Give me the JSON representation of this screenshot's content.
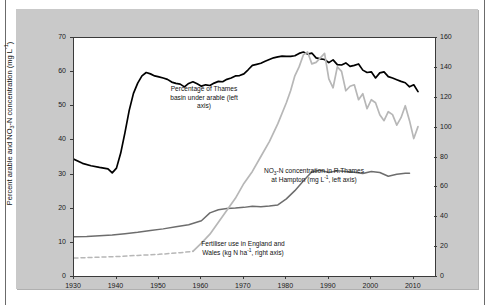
{
  "figure": {
    "panel_bg": "#c9c9c9",
    "plot_bg": "#ffffff"
  },
  "chart_data": {
    "type": "line",
    "title": "",
    "xlabel": "",
    "ylabel": "Percent arable and NO3-N concentration (mg L-1)",
    "y2label": "Fertiliser use (kg N ha-1)",
    "xlim": [
      1930,
      2015
    ],
    "ylim": [
      0,
      70
    ],
    "y2lim": [
      0,
      160
    ],
    "grid": false,
    "legend_position": "inline-annotations",
    "xticks": [
      1930,
      1940,
      1950,
      1960,
      1970,
      1980,
      1990,
      2000,
      2010
    ],
    "yticks": [
      0,
      10,
      20,
      30,
      40,
      50,
      60,
      70
    ],
    "y2ticks": [
      0,
      20,
      40,
      60,
      80,
      100,
      120,
      140,
      160
    ],
    "series": [
      {
        "name": "Percentage of Thames basin under arable",
        "axis": "left",
        "color": "#000000",
        "width": 1.7,
        "style": "solid",
        "x": [
          1930,
          1932,
          1934,
          1936,
          1938,
          1939,
          1940,
          1941,
          1942,
          1943,
          1944,
          1945,
          1946,
          1947,
          1948,
          1949,
          1950,
          1951,
          1952,
          1953,
          1954,
          1955,
          1956,
          1957,
          1958,
          1959,
          1960,
          1961,
          1962,
          1963,
          1964,
          1965,
          1966,
          1967,
          1968,
          1969,
          1970,
          1971,
          1972,
          1973,
          1974,
          1975,
          1976,
          1977,
          1978,
          1979,
          1980,
          1981,
          1982,
          1983,
          1984,
          1985,
          1986,
          1987,
          1988,
          1989,
          1990,
          1991,
          1992,
          1993,
          1994,
          1995,
          1996,
          1997,
          1998,
          1999,
          2000,
          2001,
          2002,
          2003,
          2004,
          2005,
          2006,
          2007,
          2008,
          2009,
          2010,
          2011
        ],
        "y": [
          34.2,
          33.0,
          32.3,
          31.8,
          31.4,
          30.2,
          31.6,
          36.0,
          42.0,
          48.5,
          53.5,
          56.5,
          58.6,
          59.6,
          59.2,
          58.6,
          58.3,
          58.0,
          57.6,
          56.8,
          56.4,
          56.2,
          55.4,
          56.4,
          56.9,
          56.3,
          55.6,
          56.0,
          55.8,
          56.5,
          57.0,
          56.9,
          57.6,
          58.0,
          58.6,
          58.7,
          59.2,
          60.4,
          61.7,
          62.0,
          62.3,
          62.9,
          63.4,
          63.9,
          64.2,
          64.4,
          64.3,
          64.3,
          64.5,
          65.2,
          65.6,
          65.0,
          65.3,
          63.9,
          63.6,
          63.4,
          62.5,
          63.3,
          61.9,
          61.8,
          62.4,
          61.4,
          61.7,
          62.1,
          60.3,
          59.6,
          59.8,
          58.0,
          59.5,
          59.8,
          58.4,
          58.0,
          57.5,
          57.0,
          56.6,
          55.4,
          56.0,
          54.0
        ]
      },
      {
        "name": "NO3-N concentration in R. Thames at Hampton",
        "axis": "left",
        "color": "#6d6d6d",
        "width": 1.5,
        "style": "solid",
        "x": [
          1930,
          1933,
          1936,
          1939,
          1942,
          1945,
          1948,
          1951,
          1954,
          1957,
          1960,
          1962,
          1964,
          1966,
          1968,
          1970,
          1972,
          1974,
          1976,
          1978,
          1980,
          1982,
          1984,
          1986,
          1988,
          1990,
          1992,
          1994,
          1996,
          1998,
          2000,
          2002,
          2004,
          2006,
          2008,
          2009
        ],
        "y": [
          11.5,
          11.6,
          11.8,
          12.0,
          12.4,
          12.8,
          13.3,
          13.8,
          14.4,
          15.0,
          16.2,
          18.5,
          19.4,
          19.8,
          19.9,
          20.1,
          20.4,
          20.3,
          20.5,
          20.8,
          22.6,
          25.0,
          27.8,
          30.5,
          31.0,
          30.3,
          30.8,
          30.6,
          30.4,
          30.0,
          30.6,
          30.3,
          29.2,
          29.8,
          30.1,
          30.1
        ]
      },
      {
        "name": "Fertiliser use in England and Wales (early estimate)",
        "axis": "right",
        "color": "#b7b7b7",
        "width": 1.5,
        "style": "dashed",
        "x": [
          1930,
          1935,
          1940,
          1945,
          1950,
          1955,
          1958
        ],
        "y": [
          12.0,
          12.5,
          13.0,
          13.8,
          14.5,
          15.6,
          16.5
        ]
      },
      {
        "name": "Fertiliser use in England and Wales",
        "axis": "right",
        "color": "#b7b7b7",
        "width": 1.7,
        "style": "solid",
        "x": [
          1958,
          1960,
          1962,
          1964,
          1966,
          1968,
          1970,
          1972,
          1974,
          1976,
          1978,
          1980,
          1981,
          1982,
          1983,
          1984,
          1985,
          1986,
          1987,
          1988,
          1989,
          1990,
          1991,
          1992,
          1993,
          1994,
          1995,
          1996,
          1997,
          1998,
          1999,
          2000,
          2001,
          2002,
          2003,
          2004,
          2005,
          2006,
          2007,
          2008,
          2009,
          2010,
          2011
        ],
        "y": [
          16.5,
          22.0,
          28.0,
          36.0,
          44.0,
          52.0,
          62.0,
          70.0,
          80.0,
          90.0,
          102.0,
          116.0,
          124.0,
          134.0,
          140.0,
          148.0,
          150.0,
          142.0,
          143.0,
          146.0,
          149.0,
          132.0,
          126.0,
          140.0,
          137.0,
          124.0,
          127.0,
          128.0,
          118.0,
          122.0,
          112.0,
          118.0,
          116.0,
          108.0,
          104.0,
          110.0,
          108.0,
          101.0,
          106.0,
          114.0,
          104.0,
          92.0,
          100.0
        ]
      }
    ],
    "annotations": [
      {
        "id": "arable",
        "text": "Percentage of Thames basin under arable (left axis)"
      },
      {
        "id": "nitrate",
        "text": "NO3-N concentration in R.Thames at Hampton (mg L-1, left axis)"
      },
      {
        "id": "fert",
        "text": "Fertiliser use in England and Wales (kg N ha-1, right axis)"
      }
    ]
  },
  "labels": {
    "y_left_parts": {
      "a": "Percent arable and NO",
      "sub": "3",
      "b": "-N concentration (mg L",
      "sup": "-1",
      "c": ")"
    },
    "y_right_parts": {
      "a": "Fertiliser use (kg N ha",
      "sup": "-1",
      "c": ")"
    },
    "anno_arable_l1": "Percentage of Thames",
    "anno_arable_l2": "basin under arable (left",
    "anno_arable_l3": "axis)",
    "anno_nitrate_l1a": "NO",
    "anno_nitrate_sub": "3",
    "anno_nitrate_l1b": "-N concentration in R.Thames",
    "anno_nitrate_l2a": "at Hampton (mg L",
    "anno_nitrate_sup": "-1",
    "anno_nitrate_l2b": ", left axis)",
    "anno_fert_l1": "Fertiliser use in England and",
    "anno_fert_l2a": "Wales (kg N ha",
    "anno_fert_sup": "-1",
    "anno_fert_l2b": ", right axis)"
  }
}
